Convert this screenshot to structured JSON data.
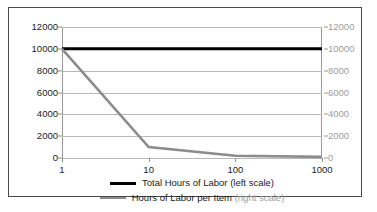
{
  "chart_data": {
    "type": "line",
    "title": "",
    "subtitle": "",
    "xlabel": "",
    "ylabel": "",
    "y2label": "",
    "xscale": "log",
    "x": [
      1,
      10,
      100,
      1000
    ],
    "xtick_labels": [
      "1",
      "10",
      "100",
      "1000"
    ],
    "xlim": [
      1,
      1000
    ],
    "ylim": [
      0,
      12000
    ],
    "ytick_labels": [
      "12000",
      "10000",
      "8000",
      "6000",
      "4000",
      "2000",
      "0"
    ],
    "ytick_values": [
      12000,
      10000,
      8000,
      6000,
      4000,
      2000,
      0
    ],
    "y2lim": [
      0,
      12000
    ],
    "y2tick_labels": [
      "12000",
      "10000",
      "8000",
      "6000",
      "4000",
      "2000",
      "0"
    ],
    "y2tick_values": [
      12000,
      10000,
      8000,
      6000,
      4000,
      2000,
      0
    ],
    "grid": true,
    "legend_position": "bottom",
    "series": [
      {
        "name": "Total Hours of Labor",
        "axis": "left",
        "scale_note": "(left scale)",
        "color": "#000000",
        "width": 3.0,
        "values": [
          10000,
          10000,
          10000,
          10000
        ]
      },
      {
        "name": "Hours of Labor per Item",
        "axis": "right",
        "scale_note": "(right scale)",
        "color": "#8c8c8c",
        "width": 2.6,
        "values": [
          10000,
          1000,
          200,
          100
        ]
      }
    ]
  },
  "legend": {
    "items": [
      {
        "label": "Total Hours of Labor",
        "scale_note": "(left scale)"
      },
      {
        "label": "Hours of Labor per Item",
        "scale_note": "(right scale)"
      }
    ]
  },
  "colors": {
    "series_primary": "#000000",
    "series_secondary": "#8c8c8c",
    "gridline": "#b9b9b9",
    "axis": "#9a9a9a",
    "frame": "#4a4a4a",
    "text": "#1a1a1a",
    "text_muted": "#9d9d9d",
    "background": "#ffffff"
  }
}
